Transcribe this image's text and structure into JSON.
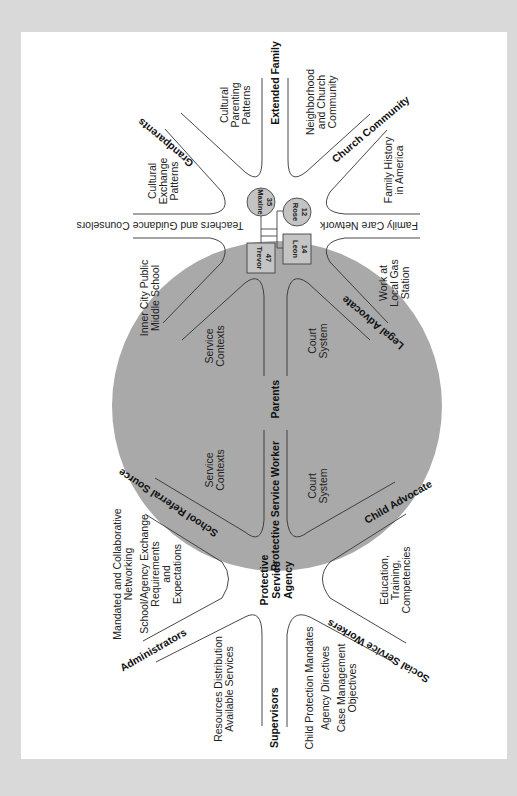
{
  "diagram": {
    "orientation": "rotated 90 degrees clockwise",
    "colors": {
      "background": "#d9d9d9",
      "panel": "#ffffff",
      "circle_fill": "#a9a9a9",
      "node_fill": "#c4c4c4",
      "line": "#333333"
    },
    "family": {
      "members": [
        {
          "name": "Maxine",
          "age": "35",
          "shape": "circle"
        },
        {
          "name": "Rose",
          "age": "12",
          "shape": "circle"
        },
        {
          "name": "Trevor",
          "age": "47",
          "shape": "square"
        },
        {
          "name": "Leon",
          "age": "14",
          "shape": "square"
        }
      ]
    },
    "outer_spokes": {
      "grandparents": "Grandparents",
      "extended_family": "Extended Family",
      "church_community": "Church Community",
      "teachers": "Teachers and Guidance Counselors",
      "family_care": "Family Care Network",
      "school_referral": "School Referral Source",
      "child_advocate": "Child Advocate",
      "administrators": "Administrators",
      "supervisors": "Supervisors",
      "social_service_workers": "Social Service Workers"
    },
    "inner_spokes": {
      "parents": "Parents",
      "legal_advocate": "Legal Advocate",
      "protective_service_worker": "Protective Service Worker",
      "protective_service_agency": [
        "Protective",
        "Service",
        "Agency"
      ]
    },
    "sector_texts": {
      "cultural_exchange": [
        "Cultural",
        "Exchange",
        "Patterns"
      ],
      "cultural_parenting": [
        "Cultural",
        "Parenting",
        "Patterns"
      ],
      "neighborhood": [
        "Neighborhood",
        "and Church",
        "Community"
      ],
      "family_history": [
        "Family History",
        "in America"
      ],
      "inner_city_school": [
        "Inner City Public",
        "Middle School"
      ],
      "work_gas_station": [
        "Work at",
        "Local Gas",
        "Station"
      ],
      "service_contexts_1": [
        "Service",
        "Contexts"
      ],
      "court_system_1": [
        "Court",
        "System"
      ],
      "service_contexts_2": [
        "Service",
        "Contexts"
      ],
      "court_system_2": [
        "Court",
        "System"
      ],
      "mandated": [
        "Mandated and Collaborative",
        "Networking",
        "School/Agency Exchange",
        "Requirements",
        "and",
        "Expectations"
      ],
      "education": [
        "Education,",
        "Training,",
        "Competencies"
      ],
      "resources": [
        "Resources Distribution",
        "Available Services"
      ],
      "child_protection": [
        "Child Protection Mandates",
        "Agency Directives",
        "Case Management",
        "Objectives"
      ]
    }
  }
}
